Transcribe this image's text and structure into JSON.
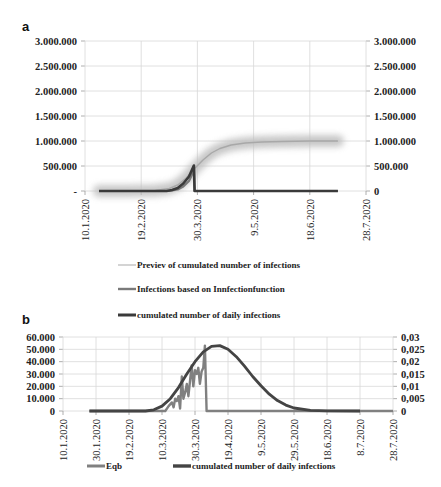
{
  "chart_data": [
    {
      "panel": "a",
      "type": "line",
      "title": "",
      "xlabel": "",
      "ylabel": "",
      "x_ticks": [
        "10.1.2020",
        "19.2.2020",
        "30.3.2020",
        "9.5.2020",
        "18.6.2020",
        "28.7.2020"
      ],
      "x_range_days": [
        0,
        200
      ],
      "y_left_ticks": [
        "-",
        "500.000",
        "1.000.000",
        "1.500.000",
        "2.000.000",
        "2.500.000",
        "3.000.000"
      ],
      "y_right_ticks": [
        "0",
        "500.000",
        "1.000.000",
        "1.500.000",
        "2.000.000",
        "2.500.000",
        "3.000.000"
      ],
      "ylim": [
        0,
        3000000
      ],
      "grid": true,
      "legend_position": "bottom",
      "series": [
        {
          "name": "Previev of cumulated number of infections",
          "color": "#b0b0b0",
          "style": "blurred-band",
          "x_days": [
            10,
            30,
            50,
            60,
            66,
            72,
            78,
            84,
            90,
            96,
            104,
            114,
            126,
            140,
            160,
            180
          ],
          "values": [
            0,
            0,
            10000,
            50000,
            120000,
            260000,
            450000,
            620000,
            760000,
            850000,
            920000,
            960000,
            980000,
            990000,
            1000000,
            1000000
          ]
        },
        {
          "name": "Infections based on Innfectionfunction",
          "color": "#7a7a7a",
          "x_days": [
            10,
            60,
            66,
            70,
            74,
            76,
            77.5,
            78,
            180
          ],
          "values": [
            0,
            0,
            30000,
            90000,
            200000,
            320000,
            500000,
            0,
            0
          ]
        },
        {
          "name": "cumulated number of daily infections",
          "color": "#3a3a3a",
          "x_days": [
            10,
            58,
            62,
            66,
            70,
            74,
            77.5,
            78,
            180
          ],
          "values": [
            0,
            0,
            20000,
            60000,
            150000,
            290000,
            510000,
            0,
            0
          ]
        }
      ]
    },
    {
      "panel": "b",
      "type": "line",
      "title": "",
      "xlabel": "",
      "ylabel": "",
      "x_ticks": [
        "10.1.2020",
        "30.1.2020",
        "19.2.2020",
        "10.3.2020",
        "30.3.2020",
        "19.4.2020",
        "9.5.2020",
        "29.5.2020",
        "18.6.2020",
        "8.7.2020",
        "28.7.2020"
      ],
      "x_range_days": [
        0,
        200
      ],
      "y_left_ticks": [
        "0",
        "10.000",
        "20.000",
        "30.000",
        "40.000",
        "50.000",
        "60.000"
      ],
      "y_right_ticks": [
        "0",
        "0,005",
        "0,01",
        "0,015",
        "0,02",
        "0,025",
        "0,03"
      ],
      "ylim_left": [
        0,
        60000
      ],
      "ylim_right": [
        0,
        0.03
      ],
      "grid": true,
      "legend_position": "bottom",
      "series": [
        {
          "name": "Eqb",
          "color": "#808080",
          "axis": "left",
          "x_days": [
            16,
            62,
            64,
            66,
            67,
            68,
            69,
            70,
            71,
            72,
            73,
            74,
            75,
            76,
            77,
            78,
            79,
            80,
            81,
            82,
            83,
            84,
            85,
            86,
            87,
            88,
            89,
            90,
            91,
            92,
            93,
            94,
            200
          ],
          "values": [
            0,
            0,
            4000,
            7000,
            3000,
            10000,
            8000,
            12000,
            2000,
            28000,
            10000,
            15000,
            22000,
            12000,
            25000,
            37000,
            20000,
            33000,
            30000,
            35000,
            22000,
            32000,
            35000,
            53000,
            0,
            0,
            0,
            0,
            0,
            0,
            0,
            0,
            0
          ]
        },
        {
          "name": "cumulated number of daily infections",
          "color": "#444444",
          "axis": "right",
          "x_days": [
            16,
            50,
            55,
            60,
            65,
            70,
            75,
            80,
            85,
            90,
            95,
            100,
            105,
            110,
            115,
            120,
            125,
            130,
            135,
            140,
            150,
            160,
            180
          ],
          "values": [
            0,
            0,
            0.0005,
            0.002,
            0.005,
            0.0095,
            0.015,
            0.02,
            0.024,
            0.0262,
            0.0265,
            0.025,
            0.022,
            0.0182,
            0.014,
            0.0102,
            0.0068,
            0.0042,
            0.0024,
            0.0012,
            0.0003,
            0.0001,
            0
          ]
        }
      ]
    }
  ]
}
